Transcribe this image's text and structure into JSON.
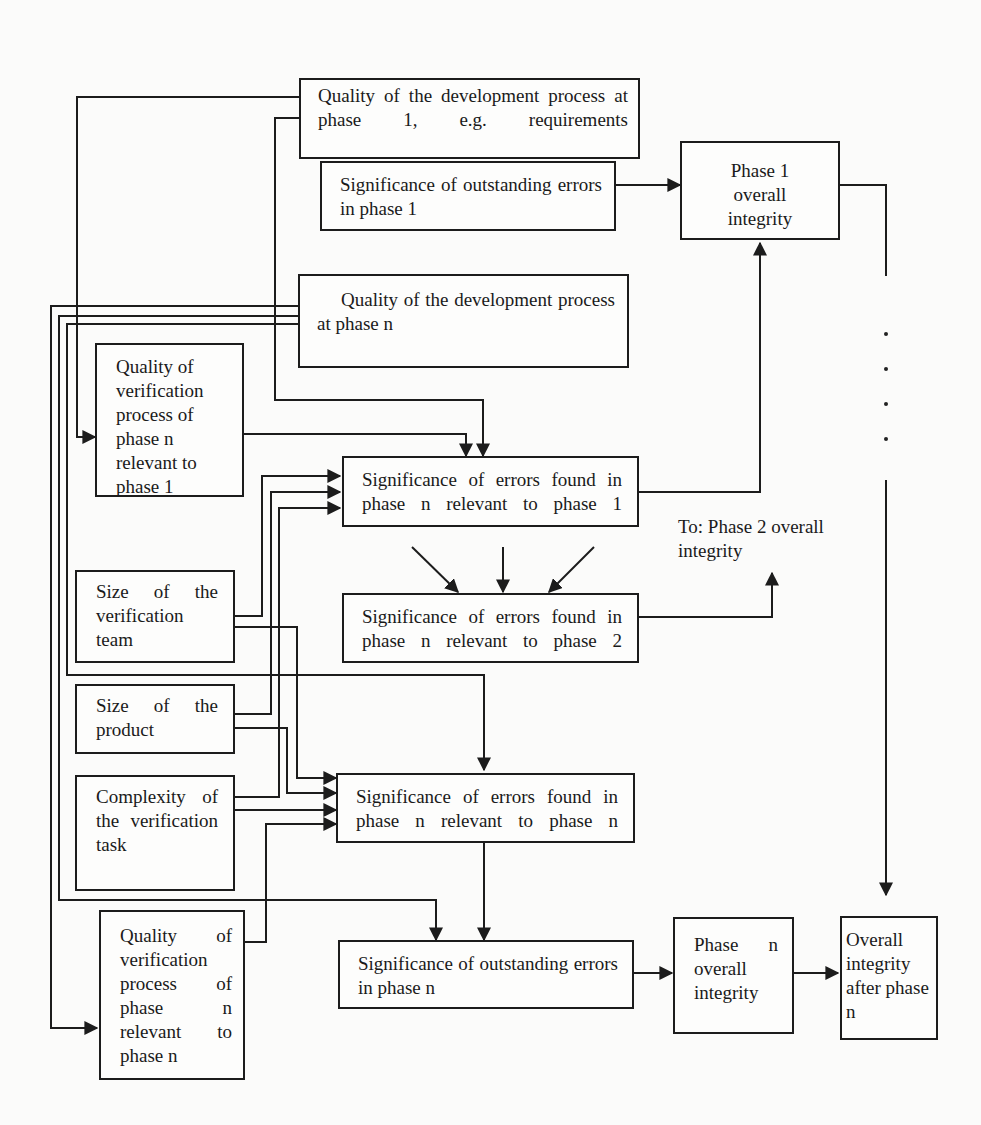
{
  "diagram": {
    "boxes": {
      "dev_quality_phase1": {
        "label": "Quality of the development process at phase 1, e.g. requirements"
      },
      "outstanding_phase1": {
        "label": "Significance of outstanding errors in phase 1"
      },
      "phase1_integrity": {
        "label": "Phase 1 overall integrity"
      },
      "dev_quality_phasen": {
        "label": "Quality of the development process at phase n"
      },
      "verif_quality_rel1": {
        "label": "Quality of verification process of phase n relevant to phase 1"
      },
      "errors_found_rel1": {
        "label": "Significance of errors found in phase n relevant to phase 1"
      },
      "errors_found_rel2": {
        "label": "Significance of errors found in phase n relevant to phase 2"
      },
      "verif_team_size": {
        "label": "Size of the verification team"
      },
      "product_size": {
        "label": "Size of the product"
      },
      "verif_complexity": {
        "label": "Complexity of the verification task"
      },
      "errors_found_reln": {
        "label": "Significance of errors found in phase n relevant to phase n"
      },
      "verif_quality_reln": {
        "label": "Quality of verification process of phase n relevant to phase n"
      },
      "outstanding_phasen": {
        "label": "Significance of outstanding errors in phase n"
      },
      "phasen_integrity": {
        "label": "Phase n overall integrity"
      },
      "overall_after_n": {
        "label": "Overall integrity after phase n"
      }
    },
    "free_labels": {
      "to_phase2": "To: Phase 2 overall integrity"
    },
    "ellipsis_dots": 4,
    "line_color": "#1c1c1c",
    "background": "#fbfbfa"
  }
}
